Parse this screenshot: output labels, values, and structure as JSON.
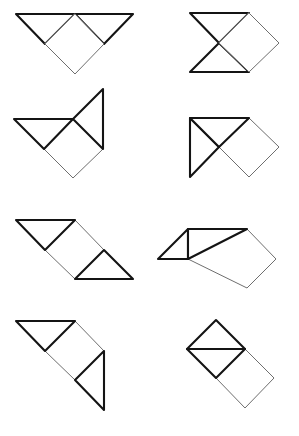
{
  "page": {
    "background_color": "#ffffff",
    "width": 299,
    "height": 436,
    "clipped_header_text": "ıı ı · · · · ı · · • · ı",
    "stroke_colors": {
      "heavy": "#141414",
      "mid": "#2a2a2a",
      "light": "#6e6e6e"
    },
    "columns": 2,
    "rows": 4,
    "figure_count": 8
  },
  "figures": [
    {
      "id": "figure-1",
      "name": "row1-left",
      "label": "",
      "description": "Two downward right triangles under a long top edge with a square hanging below",
      "row": 1,
      "column": 1,
      "pieces": [
        {
          "name": "triangle-left",
          "kind": "triangle",
          "stroke": "heavy",
          "points": "16,14 75,14 45,44"
        },
        {
          "name": "triangle-right",
          "kind": "triangle",
          "stroke": "heavy",
          "points": "75,14 133,14 104,44"
        },
        {
          "name": "square-diamond",
          "kind": "square",
          "stroke": "light",
          "points": "75,14 104,44 75,74 45,44"
        }
      ]
    },
    {
      "id": "figure-2",
      "name": "row1-right",
      "label": "",
      "description": "Bowtie of two triangles meeting at a point with a square to the right",
      "row": 1,
      "column": 2,
      "pieces": [
        {
          "name": "triangle-top",
          "kind": "triangle",
          "stroke": "heavy",
          "points": "190,13 249,13 219,43"
        },
        {
          "name": "triangle-bottom",
          "kind": "triangle",
          "stroke": "heavy",
          "points": "190,72 249,72 219,43"
        },
        {
          "name": "square-diamond",
          "kind": "square",
          "stroke": "light",
          "points": "249,13 279,43 249,72 219,43"
        }
      ]
    },
    {
      "id": "figure-3",
      "name": "row2-left",
      "label": "",
      "description": "Left pointing triangle and upward triangle with a square hanging below",
      "row": 2,
      "column": 1,
      "pieces": [
        {
          "name": "triangle-left",
          "kind": "triangle",
          "stroke": "heavy",
          "points": "14,119 73,119 44,149"
        },
        {
          "name": "triangle-upper-right",
          "kind": "triangle",
          "stroke": "heavy",
          "points": "73,119 103,89 103,149"
        },
        {
          "name": "square-diamond",
          "kind": "square",
          "stroke": "light",
          "points": "73,119 103,149 73,178 44,149"
        }
      ]
    },
    {
      "id": "figure-4",
      "name": "row2-right",
      "label": "",
      "description": "Right triangle with vertical left edge crossed by a second triangle and a square at the right",
      "row": 2,
      "column": 2,
      "pieces": [
        {
          "name": "triangle-left",
          "kind": "triangle",
          "stroke": "heavy",
          "points": "190,118 190,177 219,147"
        },
        {
          "name": "triangle-upper",
          "kind": "triangle",
          "stroke": "heavy",
          "points": "190,118 249,118 219,147"
        },
        {
          "name": "square-diamond",
          "kind": "square",
          "stroke": "light",
          "points": "249,118 279,147 249,177 219,147"
        }
      ]
    },
    {
      "id": "figure-5",
      "name": "row3-left",
      "label": "",
      "description": "Parallelogram chain of triangle, square and triangle sloping down to the right",
      "row": 3,
      "column": 1,
      "pieces": [
        {
          "name": "triangle-upper-left",
          "kind": "triangle",
          "stroke": "heavy",
          "points": "16,220 75,220 45,250"
        },
        {
          "name": "square-diamond",
          "kind": "square",
          "stroke": "light",
          "points": "75,220 104,250 75,279 45,250"
        },
        {
          "name": "triangle-lower-right",
          "kind": "triangle",
          "stroke": "heavy",
          "points": "104,250 133,279 75,279"
        }
      ]
    },
    {
      "id": "figure-6",
      "name": "row3-right",
      "label": "",
      "description": "Two triangles forming a parallelogram with a square hanging at the right",
      "row": 3,
      "column": 2,
      "pieces": [
        {
          "name": "triangle-left",
          "kind": "triangle",
          "stroke": "heavy",
          "points": "158,259 188,229 188,259"
        },
        {
          "name": "triangle-middle",
          "kind": "triangle",
          "stroke": "heavy",
          "points": "188,229 247,229 188,259"
        },
        {
          "name": "square-diamond",
          "kind": "square",
          "stroke": "light",
          "points": "247,229 276,259 247,288 188,259"
        }
      ]
    },
    {
      "id": "figure-7",
      "name": "row4-left",
      "label": "",
      "description": "Triangle at top left, central square and a downward triangle at bottom right",
      "row": 4,
      "column": 1,
      "pieces": [
        {
          "name": "triangle-upper-left",
          "kind": "triangle",
          "stroke": "heavy",
          "points": "16,321 75,321 45,351"
        },
        {
          "name": "square-diamond",
          "kind": "square",
          "stroke": "light",
          "points": "75,321 104,351 75,380 45,351"
        },
        {
          "name": "triangle-lower-right",
          "kind": "triangle",
          "stroke": "heavy",
          "points": "104,351 104,410 75,380"
        }
      ]
    },
    {
      "id": "figure-8",
      "name": "row4-right",
      "label": "",
      "description": "Square split by a horizontal line into two triangles with a second square below right",
      "row": 4,
      "column": 2,
      "pieces": [
        {
          "name": "triangle-top",
          "kind": "triangle",
          "stroke": "heavy",
          "points": "216,320 245,349 187,349"
        },
        {
          "name": "triangle-bottom",
          "kind": "triangle",
          "stroke": "heavy",
          "points": "187,349 245,349 216,378"
        },
        {
          "name": "square-diamond",
          "kind": "square",
          "stroke": "light",
          "points": "245,349 274,378 245,408 216,378"
        }
      ]
    }
  ]
}
